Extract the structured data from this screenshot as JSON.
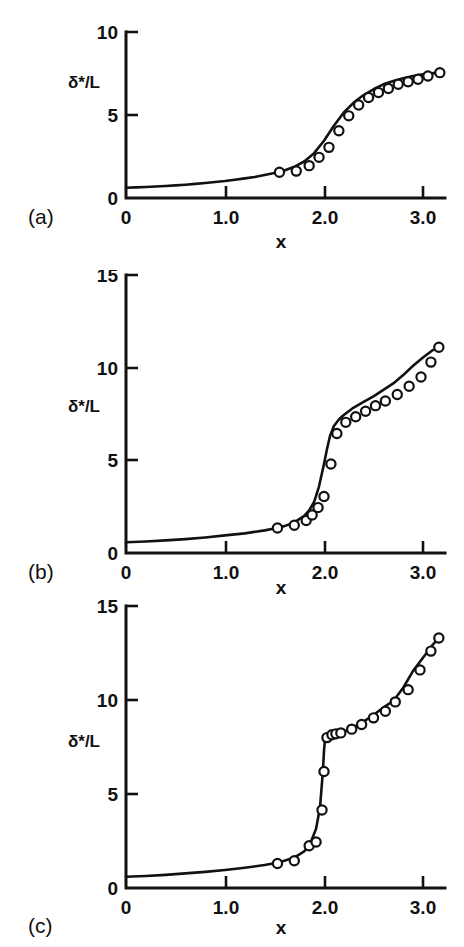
{
  "figure": {
    "kind": "multi-panel-line-plot",
    "panels_count": 3,
    "axis_color": "#111111",
    "marker_fill": "#ffffff",
    "background": "#ffffff"
  },
  "chart_data": [
    {
      "type": "line",
      "panel_label": "(a)",
      "title": "",
      "xlabel": "x",
      "ylabel": "δ*/L",
      "xlim": [
        0,
        3.25
      ],
      "ylim": [
        0,
        10
      ],
      "xticks": [
        0,
        1.0,
        2.0,
        3.0
      ],
      "xticklabels": [
        "0",
        "1.0",
        "2.0",
        "3.0"
      ],
      "yticks": [
        0,
        5,
        10
      ],
      "yticklabels": [
        "0",
        "5",
        "10"
      ],
      "grid": false,
      "legend": null,
      "series": [
        {
          "name": "theory-curve",
          "style": "solid-line",
          "x": [
            0.0,
            0.1,
            0.2,
            0.3,
            0.4,
            0.5,
            0.6,
            0.7,
            0.8,
            0.9,
            1.0,
            1.1,
            1.2,
            1.3,
            1.4,
            1.5,
            1.6,
            1.7,
            1.8,
            1.9,
            2.0,
            2.1,
            2.2,
            2.3,
            2.4,
            2.5,
            2.6,
            2.7,
            2.8,
            2.9,
            3.0,
            3.1,
            3.18
          ],
          "y": [
            0.62,
            0.64,
            0.66,
            0.69,
            0.72,
            0.76,
            0.8,
            0.85,
            0.9,
            0.96,
            1.02,
            1.1,
            1.18,
            1.27,
            1.38,
            1.5,
            1.66,
            1.88,
            2.2,
            2.7,
            3.45,
            4.35,
            5.15,
            5.75,
            6.2,
            6.55,
            6.85,
            7.05,
            7.22,
            7.35,
            7.45,
            7.52,
            7.55
          ]
        },
        {
          "name": "data-points",
          "style": "open-circle-markers",
          "x": [
            1.55,
            1.72,
            1.85,
            1.95,
            2.05,
            2.15,
            2.25,
            2.35,
            2.45,
            2.55,
            2.65,
            2.75,
            2.85,
            2.95,
            3.05,
            3.17
          ],
          "y": [
            1.55,
            1.62,
            1.95,
            2.45,
            3.05,
            4.05,
            4.95,
            5.6,
            6.05,
            6.35,
            6.6,
            6.85,
            7.0,
            7.15,
            7.35,
            7.55
          ]
        }
      ]
    },
    {
      "type": "line",
      "panel_label": "(b)",
      "title": "",
      "xlabel": "x",
      "ylabel": "δ*/L",
      "xlim": [
        0,
        3.25
      ],
      "ylim": [
        0,
        15
      ],
      "xticks": [
        0,
        1.0,
        2.0,
        3.0
      ],
      "xticklabels": [
        "0",
        "1.0",
        "2.0",
        "3.0"
      ],
      "yticks": [
        0,
        5,
        10,
        15
      ],
      "yticklabels": [
        "0",
        "5",
        "10",
        "15"
      ],
      "grid": false,
      "legend": null,
      "series": [
        {
          "name": "theory-curve",
          "style": "solid-line",
          "x": [
            0.0,
            0.2,
            0.4,
            0.6,
            0.8,
            1.0,
            1.2,
            1.4,
            1.5,
            1.6,
            1.7,
            1.8,
            1.85,
            1.9,
            1.95,
            2.0,
            2.03,
            2.06,
            2.1,
            2.15,
            2.2,
            2.3,
            2.4,
            2.5,
            2.6,
            2.7,
            2.8,
            2.9,
            3.0,
            3.1,
            3.16
          ],
          "y": [
            0.58,
            0.62,
            0.68,
            0.75,
            0.84,
            0.95,
            1.06,
            1.22,
            1.32,
            1.45,
            1.65,
            2.0,
            2.3,
            2.75,
            3.6,
            4.8,
            5.6,
            6.3,
            6.85,
            7.2,
            7.45,
            7.85,
            8.15,
            8.45,
            8.8,
            9.15,
            9.6,
            10.1,
            10.55,
            10.95,
            11.1
          ]
        },
        {
          "name": "data-points",
          "style": "open-circle-markers",
          "x": [
            1.53,
            1.7,
            1.82,
            1.88,
            1.94,
            2.0,
            2.07,
            2.13,
            2.22,
            2.32,
            2.42,
            2.52,
            2.62,
            2.74,
            2.86,
            2.98,
            3.08,
            3.16
          ],
          "y": [
            1.35,
            1.5,
            1.75,
            2.05,
            2.45,
            3.05,
            4.8,
            6.45,
            7.05,
            7.35,
            7.65,
            7.95,
            8.2,
            8.55,
            9.0,
            9.5,
            10.3,
            11.1
          ]
        }
      ]
    },
    {
      "type": "line",
      "panel_label": "(c)",
      "title": "",
      "xlabel": "x",
      "ylabel": "δ*/L",
      "xlim": [
        0,
        3.25
      ],
      "ylim": [
        0,
        15
      ],
      "xticks": [
        0,
        1.0,
        2.0,
        3.0
      ],
      "xticklabels": [
        "0",
        "1.0",
        "2.0",
        "3.0"
      ],
      "yticks": [
        0,
        5,
        10,
        15
      ],
      "yticklabels": [
        "0",
        "5",
        "10",
        "15"
      ],
      "grid": false,
      "legend": null,
      "series": [
        {
          "name": "theory-curve",
          "style": "solid-line",
          "x": [
            0.0,
            0.2,
            0.4,
            0.6,
            0.8,
            1.0,
            1.2,
            1.4,
            1.5,
            1.6,
            1.7,
            1.8,
            1.86,
            1.92,
            1.96,
            1.99,
            2.0,
            2.01,
            2.02,
            2.05,
            2.1,
            2.15,
            2.2,
            2.3,
            2.4,
            2.5,
            2.6,
            2.7,
            2.8,
            2.9,
            3.0,
            3.1,
            3.16
          ],
          "y": [
            0.6,
            0.64,
            0.7,
            0.78,
            0.86,
            0.96,
            1.08,
            1.22,
            1.32,
            1.45,
            1.62,
            1.95,
            2.35,
            3.15,
            4.3,
            6.3,
            7.3,
            7.9,
            8.05,
            8.1,
            8.15,
            8.2,
            8.3,
            8.55,
            8.85,
            9.2,
            9.6,
            9.95,
            10.65,
            11.55,
            12.25,
            12.95,
            13.3
          ]
        },
        {
          "name": "data-points",
          "style": "open-circle-markers",
          "x": [
            1.53,
            1.7,
            1.85,
            1.92,
            1.98,
            2.0,
            2.03,
            2.08,
            2.12,
            2.17,
            2.28,
            2.38,
            2.5,
            2.62,
            2.72,
            2.85,
            2.97,
            3.08,
            3.16
          ],
          "y": [
            1.3,
            1.45,
            2.25,
            2.45,
            4.15,
            6.2,
            8.0,
            8.15,
            8.2,
            8.25,
            8.45,
            8.7,
            9.05,
            9.4,
            9.9,
            10.55,
            11.6,
            12.6,
            13.3
          ]
        }
      ]
    }
  ]
}
